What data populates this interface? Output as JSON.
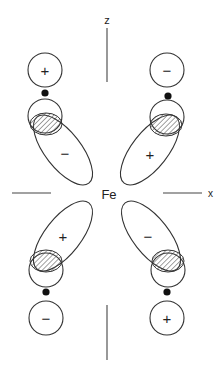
{
  "diagram": {
    "center_atom": "Fe",
    "axes": {
      "vertical_label": "z",
      "horizontal_label": "x"
    },
    "colors": {
      "line": "#333333",
      "dot": "#111111",
      "hatch": "#444444"
    },
    "groups": [
      {
        "position": "top-left",
        "p_orbital_sign": "+",
        "lobe_sign": "−"
      },
      {
        "position": "top-right",
        "p_orbital_sign": "−",
        "lobe_sign": "+"
      },
      {
        "position": "bottom-left",
        "p_orbital_sign": "−",
        "lobe_sign": "+"
      },
      {
        "position": "bottom-right",
        "p_orbital_sign": "+",
        "lobe_sign": "−"
      }
    ]
  }
}
